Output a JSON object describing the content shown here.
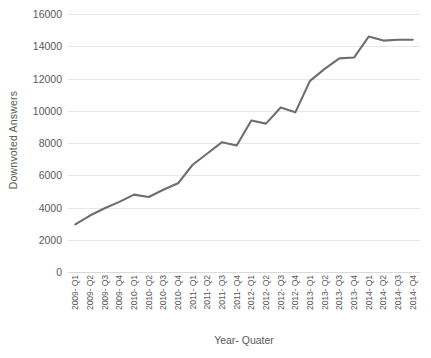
{
  "chart_data": {
    "type": "line",
    "title": "",
    "xlabel": "Year- Quater",
    "ylabel": "Downvoted Answers",
    "categories": [
      "2009- Q1",
      "2009- Q2",
      "2009- Q3",
      "2009- Q4",
      "2010- Q1",
      "2010- Q2",
      "2010- Q3",
      "2010- Q4",
      "2011- Q1",
      "2011- Q2",
      "2011- Q3",
      "2011- Q4",
      "2012- Q1",
      "2012- Q2",
      "2012- Q3",
      "2012- Q4",
      "2013- Q1",
      "2013- Q2",
      "2013- Q3",
      "2013- Q4",
      "2014- Q1",
      "2014- Q2",
      "2014- Q3",
      "2014- Q4"
    ],
    "values": [
      2950,
      3500,
      3950,
      4350,
      4800,
      4650,
      5100,
      5500,
      6650,
      7350,
      8050,
      7850,
      9400,
      9200,
      10200,
      9900,
      11850,
      12600,
      13250,
      13300,
      14600,
      14350,
      14400,
      14400
    ],
    "series": [
      {
        "name": "Downvoted Answers",
        "color": "#6e6e6e",
        "values": [
          2950,
          3500,
          3950,
          4350,
          4800,
          4650,
          5100,
          5500,
          6650,
          7350,
          8050,
          7850,
          9400,
          9200,
          10200,
          9900,
          11850,
          12600,
          13250,
          13300,
          14600,
          14350,
          14400,
          14400
        ]
      }
    ],
    "ylim": [
      0,
      16000
    ],
    "y_ticks": [
      0,
      2000,
      4000,
      6000,
      8000,
      10000,
      12000,
      14000,
      16000
    ],
    "y_tick_labels": [
      "0",
      "2000",
      "4000",
      "6000",
      "8000",
      "10000",
      "12000",
      "14000",
      "16000"
    ],
    "grid": "horizontal",
    "legend": "none",
    "line_color": "#6e6e6e",
    "line_width": 2.1,
    "gridline_color": "#e8e8e8",
    "axis_text_color": "#595959",
    "background": "#ffffff"
  }
}
